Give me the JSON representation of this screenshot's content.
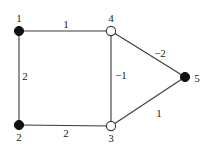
{
  "diagram": {
    "type": "weighted-graph",
    "nodes": [
      {
        "id": "1",
        "label": "1",
        "x": 19,
        "y": 31,
        "style": "filled",
        "label_x": 19,
        "label_y": 22
      },
      {
        "id": "2",
        "label": "2",
        "x": 19,
        "y": 125,
        "style": "filled",
        "label_x": 19,
        "label_y": 141
      },
      {
        "id": "3",
        "label": "3",
        "x": 111,
        "y": 126,
        "style": "open",
        "label_x": 111,
        "label_y": 142
      },
      {
        "id": "4",
        "label": "4",
        "x": 111,
        "y": 31,
        "style": "open",
        "label_x": 111,
        "label_y": 22
      },
      {
        "id": "5",
        "label": "5",
        "x": 185,
        "y": 77,
        "style": "filled",
        "label_x": 197,
        "label_y": 82
      }
    ],
    "edges": [
      {
        "from": "1",
        "to": "4",
        "weight": "1",
        "label_x": 66,
        "label_y": 28
      },
      {
        "from": "1",
        "to": "2",
        "weight": "2",
        "label_x": 25,
        "label_y": 80
      },
      {
        "from": "2",
        "to": "3",
        "weight": "2",
        "label_x": 66,
        "label_y": 137
      },
      {
        "from": "4",
        "to": "3",
        "weight": "−1",
        "label_x": 120,
        "label_y": 79
      },
      {
        "from": "4",
        "to": "5",
        "weight": "−2",
        "label_x": 159,
        "label_y": 57
      },
      {
        "from": "3",
        "to": "5",
        "weight": "1",
        "label_x": 159,
        "label_y": 117
      }
    ],
    "colors": {
      "edge": "#3a3a3a",
      "filled_node": "#111111",
      "open_node_fill": "#ffffff",
      "text": "#222222"
    }
  }
}
